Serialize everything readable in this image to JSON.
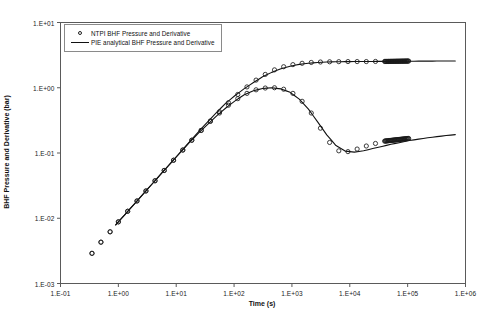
{
  "chart_data": {
    "type": "line",
    "title": "",
    "xlabel": "Time (s)",
    "ylabel": "BHF Pressure and Derivative (bar)",
    "xscale": "log",
    "yscale": "log",
    "xlim": [
      0.1,
      1000000
    ],
    "ylim": [
      0.001,
      10
    ],
    "grid": false,
    "legend_position": "top-left",
    "xtick_labels": [
      "1.E-01",
      "1.E+00",
      "1.E+01",
      "1.E+02",
      "1.E+03",
      "1.E+04",
      "1.E+05",
      "1.E+06"
    ],
    "xtick_values": [
      0.1,
      1,
      10,
      100,
      1000,
      10000,
      100000,
      1000000
    ],
    "ytick_labels": [
      "1.E-03",
      "1.E-02",
      "1.E-01",
      "1.E+00",
      "1.E+01"
    ],
    "ytick_values": [
      0.001,
      0.01,
      0.1,
      1,
      10
    ],
    "series": [
      {
        "name": "NTPI BHF Pressure and Derivative",
        "style": "markers",
        "marker": "open-circle",
        "color": "#1a1a1a",
        "curves": [
          {
            "label": "pressure",
            "x": [
              0.35,
              0.5,
              0.72,
              1.0,
              1.45,
              2.1,
              3.0,
              4.3,
              6.2,
              9.0,
              13,
              18.6,
              27,
              39,
              56,
              80,
              116,
              167,
              240,
              346,
              500,
              720,
              1040,
              1500,
              2160,
              3110,
              4480,
              6460,
              9300,
              13400,
              19300,
              27800,
              40000
            ],
            "y": [
              0.0029,
              0.0043,
              0.0062,
              0.0088,
              0.0128,
              0.0184,
              0.0262,
              0.0375,
              0.054,
              0.0775,
              0.111,
              0.157,
              0.222,
              0.31,
              0.43,
              0.59,
              0.79,
              1.03,
              1.31,
              1.6,
              1.88,
              2.1,
              2.26,
              2.37,
              2.44,
              2.48,
              2.5,
              2.51,
              2.52,
              2.52,
              2.52,
              2.53,
              2.53
            ]
          },
          {
            "label": "derivative",
            "x": [
              0.35,
              0.5,
              0.72,
              1.0,
              1.45,
              2.1,
              3.0,
              4.3,
              6.2,
              9.0,
              13,
              18.6,
              27,
              39,
              56,
              80,
              116,
              167,
              240,
              346,
              500,
              720,
              1040,
              1500,
              2160,
              3110,
              4480,
              6460,
              9300,
              13400,
              19300,
              27800,
              40000
            ],
            "y": [
              0.0029,
              0.0043,
              0.0062,
              0.0088,
              0.0128,
              0.0184,
              0.0262,
              0.0375,
              0.054,
              0.0775,
              0.111,
              0.157,
              0.222,
              0.305,
              0.41,
              0.54,
              0.68,
              0.82,
              0.93,
              0.99,
              1.0,
              0.95,
              0.82,
              0.62,
              0.41,
              0.24,
              0.145,
              0.108,
              0.105,
              0.115,
              0.128,
              0.14,
              0.152
            ]
          }
        ]
      },
      {
        "name": "PIE analytical BHF Pressure and Derivative",
        "style": "line",
        "color": "#111111",
        "curves": [
          {
            "label": "pressure",
            "x": [
              0.9,
              1.3,
              1.9,
              2.7,
              3.9,
              5.6,
              8.1,
              11.6,
              16.8,
              24,
              35,
              50,
              72,
              104,
              150,
              216,
              311,
              448,
              646,
              930,
              1340,
              1930,
              2780,
              4000,
              5770,
              8300,
              12000,
              17300,
              24900,
              35900,
              51700,
              74500,
              107000,
              155000,
              223000,
              321000,
              462000,
              666000
            ],
            "y": [
              0.0079,
              0.0114,
              0.0166,
              0.0236,
              0.0341,
              0.049,
              0.0708,
              0.101,
              0.147,
              0.209,
              0.3,
              0.42,
              0.58,
              0.76,
              0.97,
              1.2,
              1.47,
              1.72,
              1.95,
              2.14,
              2.28,
              2.38,
              2.44,
              2.48,
              2.5,
              2.51,
              2.52,
              2.525,
              2.53,
              2.535,
              2.54,
              2.545,
              2.55,
              2.555,
              2.56,
              2.565,
              2.57,
              2.575
            ]
          },
          {
            "label": "derivative",
            "x": [
              0.9,
              1.3,
              1.9,
              2.7,
              3.9,
              5.6,
              8.1,
              11.6,
              16.8,
              24,
              35,
              50,
              72,
              104,
              150,
              216,
              311,
              448,
              646,
              930,
              1340,
              1930,
              2780,
              4000,
              5770,
              8300,
              12000,
              17300,
              24900,
              35900,
              51700,
              74500,
              107000,
              155000,
              223000,
              321000,
              462000,
              666000
            ],
            "y": [
              0.0079,
              0.0114,
              0.0166,
              0.0236,
              0.0341,
              0.049,
              0.0705,
              0.1,
              0.144,
              0.2,
              0.275,
              0.37,
              0.49,
              0.63,
              0.78,
              0.9,
              0.975,
              1.0,
              0.96,
              0.85,
              0.67,
              0.47,
              0.3,
              0.19,
              0.13,
              0.107,
              0.103,
              0.108,
              0.117,
              0.126,
              0.136,
              0.145,
              0.155,
              0.163,
              0.171,
              0.178,
              0.185,
              0.191
            ]
          }
        ]
      }
    ]
  },
  "legend": {
    "entries": [
      {
        "label": "NTPI BHF Pressure and Derivative",
        "symbol": "open-circle-marker"
      },
      {
        "label": "PIE analytical BHF Pressure and Derivative",
        "symbol": "solid-line"
      }
    ]
  },
  "axes": {
    "x_title": "Time (s)",
    "y_title": "BHF Pressure and Derivative (bar)"
  }
}
